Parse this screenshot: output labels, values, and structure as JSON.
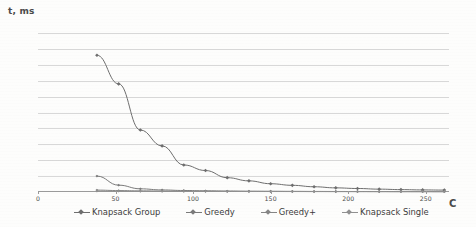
{
  "chart_data": {
    "type": "line",
    "title": "",
    "xlabel": "C",
    "ylabel": "t, ms",
    "xlim": [
      0,
      265
    ],
    "ylim": [
      0,
      10000
    ],
    "xticks": [
      0,
      50,
      100,
      150,
      200,
      250
    ],
    "yticks": [
      0,
      1000,
      2000,
      3000,
      4000,
      5000,
      6000,
      7000,
      8000,
      9000,
      10000
    ],
    "grid": true,
    "legend_position": "bottom",
    "series": [
      {
        "name": "Knapsack Group",
        "color": "#6e6e6e",
        "x": [
          38,
          52,
          66,
          80,
          94,
          108,
          122,
          136,
          150,
          164,
          178,
          192,
          206,
          220,
          234,
          248,
          262
        ],
        "values": [
          8600,
          6800,
          3900,
          2900,
          1700,
          1350,
          900,
          700,
          520,
          420,
          330,
          260,
          220,
          180,
          150,
          130,
          120
        ]
      },
      {
        "name": "Greedy",
        "color": "#7a7a7a",
        "x": [
          38,
          52,
          66,
          80,
          94,
          108,
          122,
          136,
          150,
          164,
          178,
          192,
          206,
          220,
          234,
          248,
          262
        ],
        "values": [
          1000,
          430,
          200,
          130,
          95,
          75,
          60,
          50,
          45,
          40,
          35,
          32,
          30,
          28,
          26,
          25,
          24
        ]
      },
      {
        "name": "Greedy+",
        "color": "#858585",
        "x": [
          38,
          52,
          66,
          80,
          94,
          108,
          122,
          136,
          150,
          164,
          178,
          192,
          206,
          220,
          234,
          248,
          262
        ],
        "values": [
          120,
          90,
          70,
          58,
          50,
          44,
          40,
          36,
          33,
          31,
          29,
          28,
          27,
          26,
          25,
          24,
          23
        ]
      },
      {
        "name": "Knapsack Single",
        "color": "#909090",
        "x": [
          38,
          52,
          66,
          80,
          94,
          108,
          122,
          136,
          150,
          164,
          178,
          192,
          206,
          220,
          234,
          248,
          262
        ],
        "values": [
          60,
          50,
          44,
          40,
          37,
          34,
          32,
          30,
          29,
          28,
          27,
          26,
          25,
          25,
          24,
          24,
          23
        ]
      }
    ]
  },
  "legend": {
    "items": [
      {
        "label": "Knapsack Group"
      },
      {
        "label": "Greedy"
      },
      {
        "label": "Greedy+"
      },
      {
        "label": "Knapsack Single"
      }
    ]
  },
  "axes": {
    "y_axis_title": "t, ms",
    "x_axis_title": "C"
  }
}
